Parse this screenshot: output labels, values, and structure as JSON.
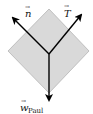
{
  "diagram": {
    "type": "free-body diagram",
    "object": {
      "shape": "diamond",
      "fill": "#d9d9d9",
      "stroke": "#bdbdbd"
    },
    "vectors": [
      {
        "id": "n",
        "symbol": "n",
        "subscript": "",
        "direction": "up-left",
        "color": "#000000"
      },
      {
        "id": "T",
        "symbol": "T",
        "subscript": "",
        "direction": "up-right",
        "color": "#000000"
      },
      {
        "id": "w",
        "symbol": "w",
        "subscript": "Paul",
        "direction": "down",
        "color": "#000000"
      }
    ],
    "labels": {
      "n": "n",
      "T": "T",
      "w": "w",
      "w_sub": "Paul",
      "arrow_over": "→"
    }
  }
}
